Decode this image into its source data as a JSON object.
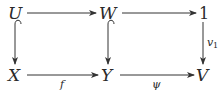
{
  "diagram": {
    "type": "commutative-diagram",
    "nodes": {
      "U": "U",
      "W": "W",
      "one": "1",
      "X": "X",
      "Y": "Y",
      "V": "V"
    },
    "labels": {
      "f": "f",
      "psi": "ψ",
      "v1_base": "v",
      "v1_sub": "1"
    },
    "edges": [
      {
        "from": "U",
        "to": "W",
        "label": "",
        "style": "arrow"
      },
      {
        "from": "W",
        "to": "1",
        "label": "",
        "style": "arrow"
      },
      {
        "from": "U",
        "to": "X",
        "label": "",
        "style": "hook-arrow"
      },
      {
        "from": "W",
        "to": "Y",
        "label": "",
        "style": "hook-arrow"
      },
      {
        "from": "1",
        "to": "V",
        "label": "v1",
        "style": "arrow"
      },
      {
        "from": "X",
        "to": "Y",
        "label": "f",
        "style": "arrow"
      },
      {
        "from": "Y",
        "to": "V",
        "label": "ψ",
        "style": "arrow"
      }
    ]
  }
}
